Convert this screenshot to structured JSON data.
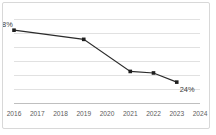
{
  "chart_data": {
    "type": "line",
    "title": "",
    "subtitle": "",
    "xlabel": "",
    "ylabel": "",
    "grid": true,
    "legend": false,
    "legend_position": "none",
    "categories": [
      "2016",
      "2017",
      "2018",
      "2019",
      "2020",
      "2021",
      "2022",
      "2023",
      "2024"
    ],
    "x": [
      2016,
      2017,
      2018,
      2019,
      2020,
      2021,
      2022,
      2023,
      2024
    ],
    "xlim": [
      2016,
      2024
    ],
    "ylim": [
      10,
      65
    ],
    "yticks": [
      65,
      58,
      51,
      44,
      37,
      30,
      23,
      16
    ],
    "series": [
      {
        "name": "value",
        "values": [
          58,
          null,
          null,
          52,
          null,
          31,
          30,
          24,
          null
        ],
        "points": [
          {
            "x": "2016",
            "y": 58,
            "label": "58%",
            "marker": true
          },
          {
            "x": "2019",
            "y": 52,
            "label": "",
            "marker": true
          },
          {
            "x": "2021",
            "y": 31,
            "label": "",
            "marker": true
          },
          {
            "x": "2022",
            "y": 30,
            "label": "",
            "marker": true
          },
          {
            "x": "2023",
            "y": 24,
            "label": "24%",
            "marker": true
          }
        ]
      }
    ],
    "annotations": [
      {
        "name": "start-value",
        "text": "58%",
        "anchor": "2016"
      },
      {
        "name": "end-value",
        "text": "24%",
        "anchor": "2023"
      }
    ],
    "colors": {
      "line": "#2b2b2b",
      "marker": "#1f1f1f",
      "gridline": "#d9d9d9",
      "axis": "#b8b8b8",
      "tick_text": "#5c5c5c",
      "value_text": "#3a3a3a",
      "border": "#d8d8d8",
      "background": "#ffffff"
    }
  },
  "axis": {
    "x_tick_labels": [
      "2016",
      "2017",
      "2018",
      "2019",
      "2020",
      "2021",
      "2022",
      "2023",
      "2024"
    ]
  },
  "labels": {
    "start_value": "58%",
    "end_value": "24%"
  }
}
